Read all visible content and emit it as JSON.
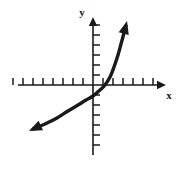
{
  "figure": {
    "name": "exponential-function-graph",
    "background_color": "#ffffff",
    "ink_color": "#1a1a1a",
    "width": 182,
    "height": 169
  },
  "axes": {
    "x_axis": {
      "label": "x",
      "label_position": "right-below-arrow",
      "line": {
        "x1": 18,
        "y1": 85,
        "x2": 163,
        "y2": 85
      },
      "arrow_at": "right",
      "arrow_tip": {
        "x": 166,
        "y": 85
      },
      "tick_length": 7,
      "tick_direction": "up",
      "tick_spacing": 10,
      "ticks_left_of_origin": 8,
      "ticks_right_of_origin": 6
    },
    "y_axis": {
      "label": "y",
      "label_position": "left-of-top-arrow",
      "line": {
        "x1": 93,
        "y1": 21,
        "x2": 93,
        "y2": 155
      },
      "arrow_at": "top",
      "arrow_tip": {
        "x": 93,
        "y": 17
      },
      "tick_length": 7,
      "tick_direction": "right",
      "tick_spacing": 10,
      "ticks_above_origin": 6,
      "ticks_below_origin": 6
    },
    "origin": {
      "x": 93,
      "y": 85
    }
  },
  "chart_data": {
    "type": "line",
    "title": "",
    "xlabel": "x",
    "ylabel": "y",
    "grid": false,
    "legend": null,
    "curve_family": "exponential",
    "arrowheads": [
      {
        "end": "lower-left",
        "x": 29,
        "y": 131
      },
      {
        "end": "upper-right",
        "x": 127,
        "y": 21
      }
    ],
    "x_intercept_px": 105,
    "y_intercept_px": 98,
    "stroke_width": 3.4,
    "points_px": [
      {
        "x": 33,
        "y": 129
      },
      {
        "x": 45,
        "y": 124
      },
      {
        "x": 57,
        "y": 118
      },
      {
        "x": 68,
        "y": 111
      },
      {
        "x": 78,
        "y": 105
      },
      {
        "x": 86,
        "y": 100
      },
      {
        "x": 93,
        "y": 96
      },
      {
        "x": 100,
        "y": 90
      },
      {
        "x": 105,
        "y": 85
      },
      {
        "x": 110,
        "y": 77
      },
      {
        "x": 114,
        "y": 67
      },
      {
        "x": 118,
        "y": 55
      },
      {
        "x": 121,
        "y": 44
      },
      {
        "x": 124,
        "y": 33
      },
      {
        "x": 126,
        "y": 26
      }
    ]
  }
}
